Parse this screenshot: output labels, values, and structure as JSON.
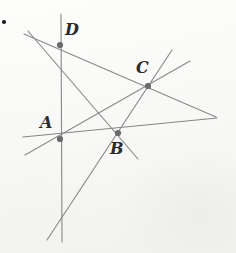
{
  "figure": {
    "medium": "pencil sketch on scanned paper",
    "canvas": {
      "width": 236,
      "height": 253
    },
    "colors": {
      "paper": "#fbfbfa",
      "line": "#8a8a8a",
      "line_dark": "#6f6f6f",
      "node": "#6a6a6a",
      "label": "#2b2b2b",
      "stray_dot": "#1a1a1a"
    },
    "stroke_width": 1.15,
    "nodes": [
      {
        "id": "A",
        "label": "A",
        "x": 60,
        "y": 139,
        "radius": 3.1,
        "label_x": 40,
        "label_y": 115,
        "label_size": 16
      },
      {
        "id": "B",
        "label": "B",
        "x": 118,
        "y": 133,
        "radius": 3.1,
        "label_x": 110,
        "label_y": 141,
        "label_size": 16
      },
      {
        "id": "C",
        "label": "C",
        "x": 148,
        "y": 86,
        "radius": 3.1,
        "label_x": 136,
        "label_y": 60,
        "label_size": 16
      },
      {
        "id": "D",
        "label": "D",
        "x": 60,
        "y": 45,
        "radius": 3.1,
        "label_x": 65,
        "label_y": 22,
        "label_size": 16
      }
    ],
    "lines": [
      {
        "id": "line-vertical-D-A",
        "x1": 61,
        "y1": 14,
        "x2": 62,
        "y2": 242,
        "note": "near-vertical line through D and A"
      },
      {
        "id": "line-D-B-extended",
        "x1": 28,
        "y1": 31,
        "x2": 138,
        "y2": 159,
        "note": "from upper-left through D and B, down to lower right"
      },
      {
        "id": "line-D-C-right",
        "x1": 24,
        "y1": 34,
        "x2": 216,
        "y2": 117,
        "note": "shallow line from left edge through D toward right vertex"
      },
      {
        "id": "line-A-C-upper",
        "x1": 25,
        "y1": 155,
        "x2": 190,
        "y2": 61,
        "note": "from lower-left through A and C to upper right"
      },
      {
        "id": "line-A-B-right",
        "x1": 23,
        "y1": 137,
        "x2": 217,
        "y2": 118,
        "note": "near-horizontal through A and B to right vertex"
      },
      {
        "id": "line-B-C-upper",
        "x1": 47,
        "y1": 240,
        "x2": 172,
        "y2": 50,
        "note": "steep line from bottom-left through B and C to top right"
      }
    ],
    "right_vertex": {
      "x": 216,
      "y": 117,
      "note": "convergence of two long lines at right"
    },
    "stray_dot": {
      "x": 4,
      "y": 22,
      "radius": 2.1,
      "note": "small ink dot near top-left corner"
    }
  }
}
